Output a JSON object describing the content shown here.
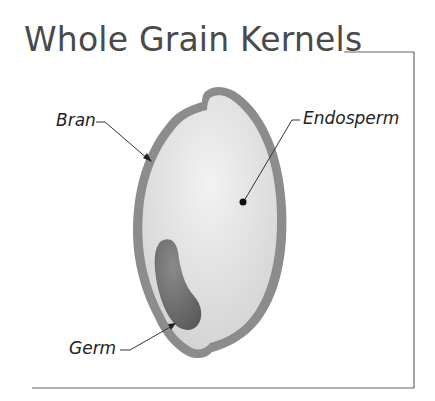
{
  "title": "Whole Grain Kernels",
  "labels": {
    "bran": "Bran",
    "endosperm": "Endosperm",
    "germ": "Germ"
  },
  "colors": {
    "bran": "#8c8c8c",
    "endosperm": "#dcdcdc",
    "germ": "#6e6e6e",
    "frame": "#666666",
    "text": "#4a4a4a"
  }
}
